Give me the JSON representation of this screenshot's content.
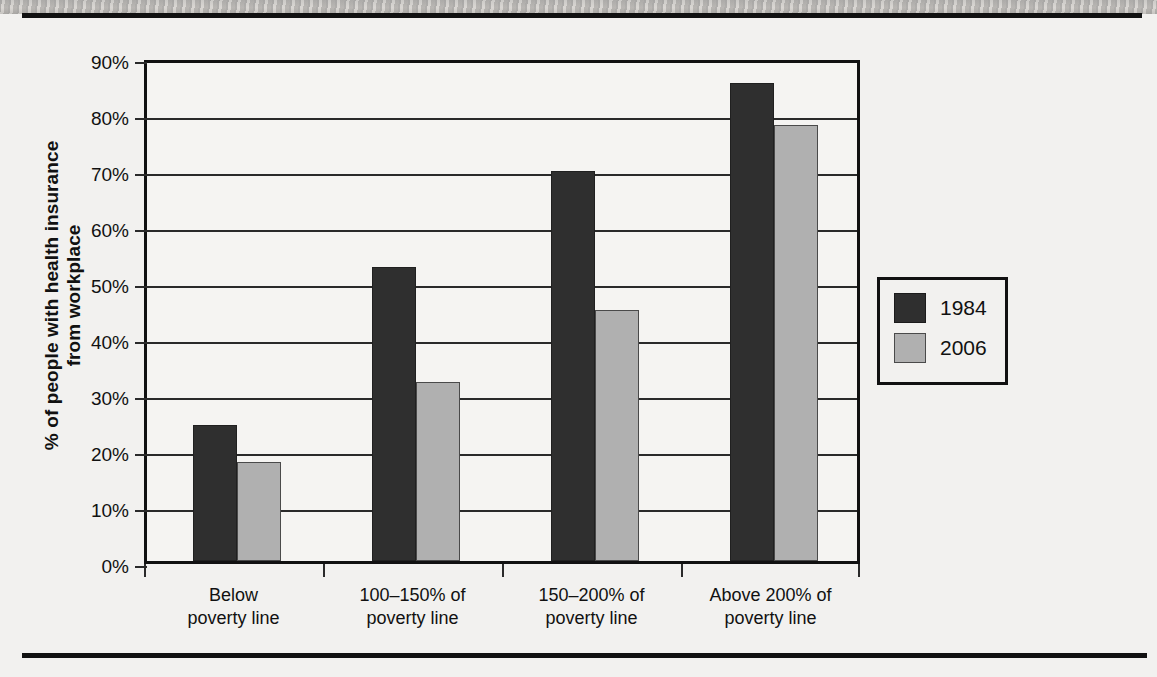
{
  "chart_data": {
    "type": "bar",
    "title": "",
    "xlabel": "",
    "ylabel": "% of people with health insurance from workplace",
    "ylabel_lines": [
      "% of people with health insurance",
      "from workplace"
    ],
    "ylim": [
      0,
      90
    ],
    "ytick_step": 10,
    "ytick_labels": [
      "90%",
      "80%",
      "70%",
      "60%",
      "50%",
      "40%",
      "30%",
      "20%",
      "10%",
      "0%"
    ],
    "ytick_values": [
      90,
      80,
      70,
      60,
      50,
      40,
      30,
      20,
      10,
      0
    ],
    "grid": true,
    "legend_position": "right",
    "categories": [
      "Below poverty line",
      "100–150% of poverty line",
      "150–200% of poverty line",
      "Above 200% of poverty line"
    ],
    "category_lines": [
      [
        "Below",
        "poverty line"
      ],
      [
        "100–150% of",
        "poverty line"
      ],
      [
        "150–200% of",
        "poverty line"
      ],
      [
        "Above 200% of",
        "poverty line"
      ]
    ],
    "series": [
      {
        "name": "1984",
        "color": "#2f2f2f",
        "values": [
          24.2,
          52.5,
          69.6,
          85.3
        ]
      },
      {
        "name": "2006",
        "color": "#b0b0b0",
        "values": [
          17.7,
          32.0,
          44.8,
          77.8
        ]
      }
    ]
  },
  "legend": {
    "entries": [
      {
        "label": "1984",
        "color": "#2f2f2f"
      },
      {
        "label": "2006",
        "color": "#b0b0b0"
      }
    ]
  }
}
